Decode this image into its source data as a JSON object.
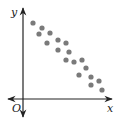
{
  "chart_data": {
    "type": "scatter",
    "title": "",
    "xlabel": "x",
    "ylabel": "y",
    "origin_label": "O",
    "grid": false,
    "legend": null,
    "points_px": [
      [
        33,
        23
      ],
      [
        42,
        28
      ],
      [
        39,
        34
      ],
      [
        50,
        33
      ],
      [
        47,
        43
      ],
      [
        58,
        40
      ],
      [
        66,
        43
      ],
      [
        58,
        50
      ],
      [
        69,
        52
      ],
      [
        66,
        60
      ],
      [
        74,
        62
      ],
      [
        82,
        60
      ],
      [
        86,
        68
      ],
      [
        79,
        75
      ],
      [
        91,
        77
      ],
      [
        99,
        81
      ],
      [
        91,
        85
      ],
      [
        102,
        90
      ]
    ],
    "points": [
      {
        "x": 1.0,
        "y": 7.6
      },
      {
        "x": 1.9,
        "y": 7.1
      },
      {
        "x": 1.6,
        "y": 6.5
      },
      {
        "x": 2.7,
        "y": 6.6
      },
      {
        "x": 2.4,
        "y": 5.6
      },
      {
        "x": 3.5,
        "y": 5.9
      },
      {
        "x": 4.3,
        "y": 5.6
      },
      {
        "x": 3.5,
        "y": 4.9
      },
      {
        "x": 4.6,
        "y": 4.7
      },
      {
        "x": 4.3,
        "y": 3.9
      },
      {
        "x": 5.1,
        "y": 3.7
      },
      {
        "x": 5.9,
        "y": 3.9
      },
      {
        "x": 6.3,
        "y": 3.1
      },
      {
        "x": 5.6,
        "y": 2.4
      },
      {
        "x": 6.8,
        "y": 2.2
      },
      {
        "x": 7.6,
        "y": 1.8
      },
      {
        "x": 6.8,
        "y": 1.4
      },
      {
        "x": 7.9,
        "y": 0.9
      }
    ],
    "axes": {
      "origin_px": [
        23,
        99
      ],
      "x_end_px": 112,
      "x_start_px": 8,
      "y_top_px": 8,
      "y_bottom_px": 117
    },
    "colors": {
      "axis": "#222222",
      "point": "#7a7a7a"
    }
  }
}
